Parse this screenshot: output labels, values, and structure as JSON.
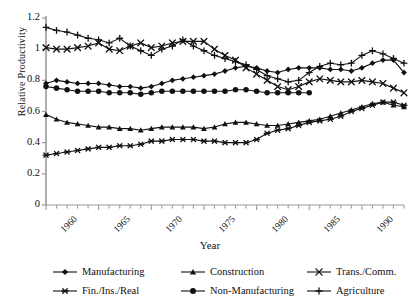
{
  "chart_data": {
    "type": "line",
    "title": "",
    "xlabel": "Year",
    "ylabel": "Relative Productivity",
    "xlim": [
      1960,
      1994
    ],
    "ylim": [
      0,
      1.2
    ],
    "ytick_labels": [
      "0",
      "0.2",
      "0.4",
      "0.6",
      "0.8",
      "1",
      "1.2"
    ],
    "ytick_values": [
      0,
      0.2,
      0.4,
      0.6,
      0.8,
      1.0,
      1.2
    ],
    "xtick_labels": [
      "1960",
      "1965",
      "1970",
      "1975",
      "1980",
      "1985",
      "1990"
    ],
    "xtick_values": [
      1960,
      1965,
      1970,
      1975,
      1980,
      1985,
      1990
    ],
    "minor_xticks_every": 1,
    "grid": false,
    "legend_position": "bottom",
    "x": [
      1960,
      1961,
      1962,
      1963,
      1964,
      1965,
      1966,
      1967,
      1968,
      1969,
      1970,
      1971,
      1972,
      1973,
      1974,
      1975,
      1976,
      1977,
      1978,
      1979,
      1980,
      1981,
      1982,
      1983,
      1984,
      1985,
      1986,
      1987,
      1988,
      1989,
      1990,
      1991,
      1992,
      1993,
      1994
    ],
    "series": [
      {
        "name": "Manufacturing",
        "marker": "diamond",
        "values": [
          0.78,
          0.8,
          0.79,
          0.78,
          0.78,
          0.78,
          0.77,
          0.76,
          0.76,
          0.75,
          0.76,
          0.78,
          0.8,
          0.81,
          0.82,
          0.83,
          0.84,
          0.86,
          0.88,
          0.89,
          0.88,
          0.86,
          0.85,
          0.87,
          0.88,
          0.88,
          0.88,
          0.87,
          0.87,
          0.86,
          0.88,
          0.91,
          0.93,
          0.93,
          0.85
        ]
      },
      {
        "name": "Construction",
        "marker": "triangle",
        "values": [
          0.58,
          0.55,
          0.53,
          0.52,
          0.51,
          0.5,
          0.5,
          0.49,
          0.49,
          0.48,
          0.49,
          0.5,
          0.5,
          0.5,
          0.5,
          0.49,
          0.5,
          0.52,
          0.53,
          0.53,
          0.52,
          0.51,
          0.51,
          0.52,
          0.53,
          0.54,
          0.55,
          0.57,
          0.59,
          0.61,
          0.63,
          0.65,
          0.66,
          0.64,
          0.63
        ]
      },
      {
        "name": "Trans./Comm.",
        "marker": "x",
        "values": [
          1.01,
          1.0,
          1.0,
          1.01,
          1.02,
          1.04,
          1.0,
          0.99,
          1.02,
          1.04,
          1.01,
          1.02,
          1.04,
          1.05,
          1.05,
          1.05,
          1.0,
          0.96,
          0.93,
          0.88,
          0.84,
          0.8,
          0.76,
          0.74,
          0.76,
          0.79,
          0.81,
          0.8,
          0.79,
          0.79,
          0.8,
          0.79,
          0.78,
          0.75,
          0.72
        ]
      },
      {
        "name": "Fin./Ins./Real",
        "marker": "star",
        "values": [
          0.32,
          0.33,
          0.34,
          0.35,
          0.36,
          0.37,
          0.37,
          0.38,
          0.38,
          0.39,
          0.41,
          0.41,
          0.42,
          0.42,
          0.42,
          0.41,
          0.41,
          0.4,
          0.4,
          0.4,
          0.42,
          0.46,
          0.48,
          0.49,
          0.51,
          0.53,
          0.54,
          0.55,
          0.57,
          0.6,
          0.62,
          0.64,
          0.66,
          0.66,
          0.64
        ]
      },
      {
        "name": "Non-Manufacturing",
        "marker": "circle",
        "values": [
          0.76,
          0.75,
          0.74,
          0.73,
          0.73,
          0.73,
          0.72,
          0.72,
          0.72,
          0.71,
          0.72,
          0.73,
          0.73,
          0.73,
          0.73,
          0.73,
          0.73,
          0.73,
          0.74,
          0.74,
          0.73,
          0.72,
          0.72,
          0.72,
          0.72,
          0.72,
          null,
          null,
          null,
          null,
          null,
          null,
          null,
          null,
          null
        ]
      },
      {
        "name": "Agriculture",
        "marker": "plus",
        "values": [
          1.14,
          1.12,
          1.11,
          1.09,
          1.07,
          1.06,
          1.04,
          1.07,
          1.02,
          0.99,
          0.96,
          1.0,
          1.02,
          1.06,
          1.02,
          0.99,
          0.96,
          0.94,
          0.92,
          0.9,
          0.87,
          0.83,
          0.81,
          0.79,
          0.8,
          0.85,
          0.89,
          0.91,
          0.9,
          0.91,
          0.96,
          0.99,
          0.97,
          0.94,
          0.91
        ]
      }
    ]
  },
  "legend": {
    "items": [
      {
        "label": "Manufacturing",
        "marker": "diamond"
      },
      {
        "label": "Construction",
        "marker": "triangle"
      },
      {
        "label": "Trans./Comm.",
        "marker": "x"
      },
      {
        "label": "Fin./Ins./Real",
        "marker": "star"
      },
      {
        "label": "Non-Manufacturing",
        "marker": "circle"
      },
      {
        "label": "Agriculture",
        "marker": "plus"
      }
    ]
  },
  "colors": {
    "ink": "#111111",
    "axis": "#9a9a9a",
    "background": "#ffffff"
  }
}
